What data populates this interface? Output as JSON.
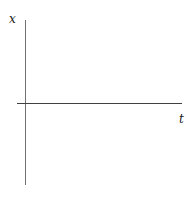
{
  "diagram": {
    "type": "empty coordinate axes",
    "vertical_axis_label": "x",
    "horizontal_axis_label": "t"
  }
}
